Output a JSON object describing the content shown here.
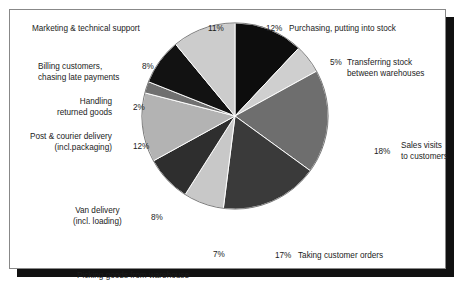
{
  "chart_data": {
    "type": "pie",
    "title": "",
    "subtitle": "",
    "xlabel": "",
    "ylabel": "",
    "legend_position": "around-slices",
    "grid": false,
    "start_angle_deg": 0,
    "direction": "clockwise",
    "categories": [
      "Purchasing, putting into stock",
      "Transferring stock between warehouses",
      "Sales visits to customers",
      "Taking customer orders",
      "Picking goods from warehouse",
      "Van delivery (incl. loading)",
      "Post & courier delivery (incl.packaging)",
      "Handling returned goods",
      "Billing customers, chasing late payments",
      "Marketing & technical support"
    ],
    "values": [
      12,
      5,
      18,
      17,
      7,
      8,
      12,
      2,
      8,
      11
    ],
    "value_labels": [
      "12%",
      "5%",
      "18%",
      "17%",
      "7%",
      "8%",
      "12%",
      "2%",
      "8%",
      "11%"
    ],
    "colors": [
      "#0d0d0d",
      "#cfcfcf",
      "#6e6e6e",
      "#3a3a3a",
      "#c8c8c8",
      "#2e2e2e",
      "#b3b3b3",
      "#707070",
      "#121212",
      "#cccccc"
    ],
    "slices": [
      {
        "label": "Purchasing, putting into stock",
        "value": 12,
        "value_label": "12%",
        "color": "#0d0d0d"
      },
      {
        "label": "Transferring stock between warehouses",
        "value": 5,
        "value_label": "5%",
        "color": "#cfcfcf"
      },
      {
        "label": "Sales visits to customers",
        "value": 18,
        "value_label": "18%",
        "color": "#6e6e6e"
      },
      {
        "label": "Taking customer orders",
        "value": 17,
        "value_label": "17%",
        "color": "#3a3a3a"
      },
      {
        "label": "Picking goods from warehouse",
        "value": 7,
        "value_label": "7%",
        "color": "#c8c8c8"
      },
      {
        "label": "Van delivery (incl. loading)",
        "value": 8,
        "value_label": "8%",
        "color": "#2e2e2e"
      },
      {
        "label": "Post & courier delivery (incl.packaging)",
        "value": 12,
        "value_label": "12%",
        "color": "#b3b3b3"
      },
      {
        "label": "Handling returned goods",
        "value": 2,
        "value_label": "2%",
        "color": "#707070"
      },
      {
        "label": "Billing customers, chasing late payments",
        "value": 8,
        "value_label": "8%",
        "color": "#121212"
      },
      {
        "label": "Marketing & technical support",
        "value": 11,
        "value_label": "11%",
        "color": "#cccccc"
      }
    ]
  },
  "labels": {
    "marketing": {
      "line1": "Marketing & technical support",
      "pct": "11%"
    },
    "purchasing": {
      "line1": "Purchasing, putting into stock",
      "pct": "12%"
    },
    "transferring": {
      "line1": "Transferring stock",
      "line2": "between warehouses",
      "pct": "5%"
    },
    "sales": {
      "line1": "Sales visits",
      "line2": "to customers",
      "pct": "18%"
    },
    "taking": {
      "line1": "Taking customer orders",
      "pct": "17%"
    },
    "picking": {
      "line1": "Picking goods from warehouse",
      "pct": "7%"
    },
    "van": {
      "line1": "Van delivery",
      "line2": "(incl. loading)",
      "pct": "8%"
    },
    "post": {
      "line1": "Post & courier delivery",
      "line2": "(incl.packaging)",
      "pct": "12%"
    },
    "handling": {
      "line1": "Handling",
      "line2": "returned goods",
      "pct": "2%"
    },
    "billing": {
      "line1": "Billing customers,",
      "line2": "chasing late payments",
      "pct": "8%"
    }
  }
}
